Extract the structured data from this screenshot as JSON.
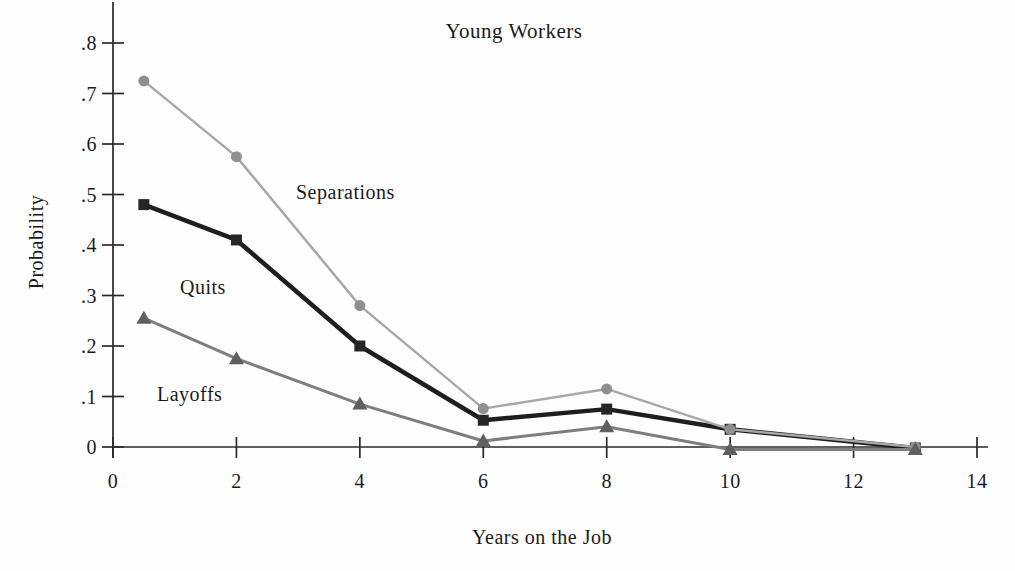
{
  "figure": {
    "title": "Young Workers",
    "xlabel": "Years on the Job",
    "ylabel": "Probability"
  },
  "colors": {
    "axis": "#2a2a2a",
    "text": "#1b1b1b",
    "separations_line": "#a8a8a8",
    "separations_marker": "#8f8f8f",
    "quits_line": "#1e1e1e",
    "quits_marker": "#262626",
    "layoffs_line": "#7e7e7e",
    "layoffs_marker": "#5f5f5f"
  },
  "chart_data": {
    "type": "line",
    "title": "Young Workers",
    "xlabel": "Years on the Job",
    "ylabel": "Probability",
    "xlim": [
      0,
      14
    ],
    "ylim": [
      0,
      0.8
    ],
    "grid": false,
    "legend": "inline-labels",
    "x_ticks": {
      "values": [
        0,
        2,
        4,
        6,
        8,
        10,
        12,
        14
      ],
      "labels": [
        "0",
        "2",
        "4",
        "6",
        "8",
        "10",
        "12",
        "14"
      ]
    },
    "y_ticks": {
      "values": [
        0,
        0.1,
        0.2,
        0.3,
        0.4,
        0.5,
        0.6,
        0.7,
        0.8
      ],
      "labels": [
        "0",
        ".1",
        ".2",
        ".3",
        ".4",
        ".5",
        ".6",
        ".7",
        ".8"
      ]
    },
    "x": [
      0.5,
      2,
      4,
      6,
      8,
      10,
      13
    ],
    "series": [
      {
        "name": "Quits",
        "marker": "square",
        "line_color": "#1e1e1e",
        "marker_color": "#262626",
        "line_width": 4.5,
        "values": [
          0.48,
          0.41,
          0.2,
          0.053,
          0.075,
          0.035,
          -0.002
        ]
      },
      {
        "name": "Separations",
        "marker": "circle",
        "line_color": "#a8a8a8",
        "marker_color": "#8f8f8f",
        "line_width": 2.5,
        "values": [
          0.725,
          0.575,
          0.28,
          0.076,
          0.115,
          0.035,
          0.0
        ]
      },
      {
        "name": "Layoffs",
        "marker": "triangle",
        "line_color": "#7e7e7e",
        "marker_color": "#5f5f5f",
        "line_width": 3,
        "values": [
          0.255,
          0.175,
          0.085,
          0.012,
          0.04,
          -0.005,
          -0.005
        ]
      }
    ]
  }
}
